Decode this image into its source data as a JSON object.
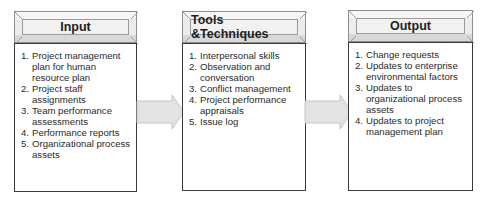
{
  "diagram": {
    "blocks": [
      {
        "title": "Input",
        "items": [
          {
            "num": "1.",
            "text": "Project management plan for human resource plan"
          },
          {
            "num": "2.",
            "text": "Project staff assignments"
          },
          {
            "num": "3.",
            "text": "Team performance assessments"
          },
          {
            "num": "4.",
            "text": "Performance reports"
          },
          {
            "num": "5.",
            "text": "Organizational process assets"
          }
        ]
      },
      {
        "title": "Tools &Techniques",
        "items": [
          {
            "num": "1.",
            "text": "Interpersonal skills"
          },
          {
            "num": "2.",
            "text": "Observation and conversation"
          },
          {
            "num": "3.",
            "text": "Conflict management"
          },
          {
            "num": "4.",
            "text": "Project performance appraisals"
          },
          {
            "num": "5.",
            "text": "Issue log"
          }
        ]
      },
      {
        "title": "Output",
        "items": [
          {
            "num": "1.",
            "text": "Change requests"
          },
          {
            "num": "2.",
            "text": "Updates to enterprise environmental factors"
          },
          {
            "num": "3.",
            "text": "Updates to organizational process assets"
          },
          {
            "num": "4.",
            "text": "Updates to project management plan"
          }
        ]
      }
    ],
    "arrows": [
      {
        "from": "Input",
        "to": "Tools &Techniques"
      },
      {
        "from": "Tools &Techniques",
        "to": "Output"
      }
    ],
    "colors": {
      "box_border": "#3a3a3a",
      "header_fill": "#ececec",
      "arrow_fill": "#e3e3e3",
      "arrow_stroke": "#c4c4c4"
    }
  }
}
